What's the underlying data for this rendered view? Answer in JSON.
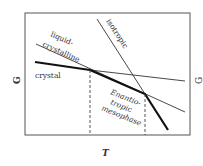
{
  "diagram": {
    "axes": {
      "ylabel": "G",
      "xlabel": "T",
      "right_cut_label": "G"
    },
    "labels": {
      "liquid_line1": "liquid-",
      "liquid_line2": "crystalline",
      "isotropic": "isotropic",
      "crystal": "crystal",
      "meso_line1": "Enantio-",
      "meso_line2": "tropic",
      "meso_line3": "mesophase"
    },
    "colors": {
      "line": "#222222",
      "frame": "#555555",
      "background": "#ffffff"
    }
  }
}
